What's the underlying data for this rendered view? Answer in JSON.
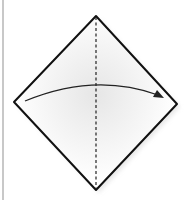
{
  "diagram": {
    "type": "origami-step",
    "shape": {
      "name": "diamond",
      "vertices": {
        "top": [
          96,
          16
        ],
        "right": [
          177,
          104
        ],
        "bottom": [
          96,
          190
        ],
        "left": [
          14,
          102
        ]
      },
      "stroke": "#111111",
      "fill": "#ffffff",
      "shading": "#ebebeb"
    },
    "fold_line": {
      "style": "dashed",
      "from": [
        96,
        16
      ],
      "to": [
        96,
        190
      ],
      "color": "#222222"
    },
    "arrow": {
      "from": [
        25,
        101
      ],
      "to": [
        163,
        97
      ],
      "direction": "left-to-right",
      "color": "#222222"
    },
    "border": {
      "color": "#c8c8c8"
    }
  }
}
